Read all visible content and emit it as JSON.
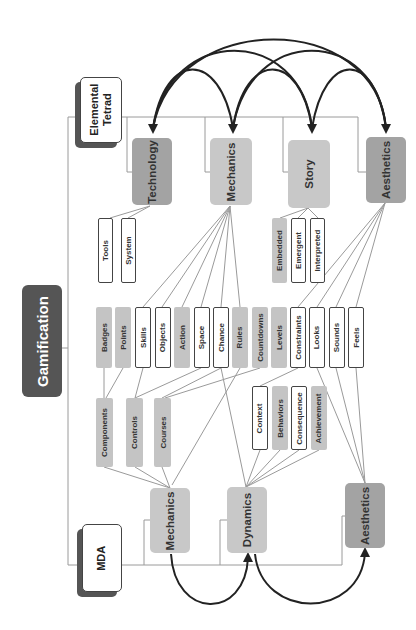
{
  "title": "Gamification",
  "frameworks": {
    "elemental_tetrad": {
      "label": "Elemental\nTetrad",
      "elements": [
        {
          "label": "Technology",
          "shade": "dark",
          "children": [
            "Tools",
            "System"
          ]
        },
        {
          "label": "Mechanics",
          "shade": "light",
          "children": [
            "Badges",
            "Points",
            "Skills",
            "Objects",
            "Action",
            "Space",
            "Chance",
            "Rules",
            "Countdowns",
            "Levels",
            "Constraints"
          ]
        },
        {
          "label": "Story",
          "shade": "light",
          "children": [
            "Embedded",
            "Emergent",
            "Interpreted"
          ]
        },
        {
          "label": "Aesthetics",
          "shade": "dark",
          "children": [
            "Constraints",
            "Looks",
            "Sounds",
            "Feels"
          ]
        }
      ]
    },
    "mda": {
      "label": "MDA",
      "elements": [
        {
          "label": "Mechanics",
          "shade": "light",
          "children": [
            "Components",
            "Controls",
            "Courses"
          ]
        },
        {
          "label": "Dynamics",
          "shade": "light",
          "children": [
            "Context",
            "Behaviors",
            "Consequence",
            "Achievement"
          ]
        },
        {
          "label": "Aesthetics",
          "shade": "dark",
          "children": [
            "Looks",
            "Sounds",
            "Feels"
          ]
        }
      ]
    }
  },
  "tetrad_children": {
    "technology": [
      {
        "label": "Tools",
        "style": "outlined"
      },
      {
        "label": "System",
        "style": "outlined"
      }
    ],
    "story": [
      {
        "label": "Embedded",
        "style": "filled"
      },
      {
        "label": "Emergent",
        "style": "outlined"
      },
      {
        "label": "Interpreted",
        "style": "outlined"
      }
    ]
  },
  "shared_items": [
    {
      "label": "Badges",
      "style": "filled"
    },
    {
      "label": "Points",
      "style": "filled"
    },
    {
      "label": "Skills",
      "style": "outlined"
    },
    {
      "label": "Objects",
      "style": "outlined"
    },
    {
      "label": "Action",
      "style": "filled"
    },
    {
      "label": "Space",
      "style": "outlined"
    },
    {
      "label": "Chance",
      "style": "outlined"
    },
    {
      "label": "Rules",
      "style": "filled"
    },
    {
      "label": "Countdowns",
      "style": "filled"
    },
    {
      "label": "Levels",
      "style": "filled"
    },
    {
      "label": "Constraints",
      "style": "outlined"
    },
    {
      "label": "Looks",
      "style": "outlined"
    },
    {
      "label": "Sounds",
      "style": "outlined"
    },
    {
      "label": "Feels",
      "style": "outlined"
    }
  ],
  "mda_children": {
    "mechanics": [
      {
        "label": "Components",
        "style": "filled"
      },
      {
        "label": "Controls",
        "style": "filled"
      },
      {
        "label": "Courses",
        "style": "filled"
      }
    ],
    "dynamics": [
      {
        "label": "Context",
        "style": "outlined"
      },
      {
        "label": "Behaviors",
        "style": "filled"
      },
      {
        "label": "Consequence",
        "style": "outlined"
      },
      {
        "label": "Achievement",
        "style": "filled"
      }
    ]
  },
  "colors": {
    "root": "#555555",
    "dark_element": "#a3a3a3",
    "light_element": "#c8c8c8",
    "filled_item": "#c4c4c4",
    "line": "#999999",
    "arrow": "#222222"
  }
}
